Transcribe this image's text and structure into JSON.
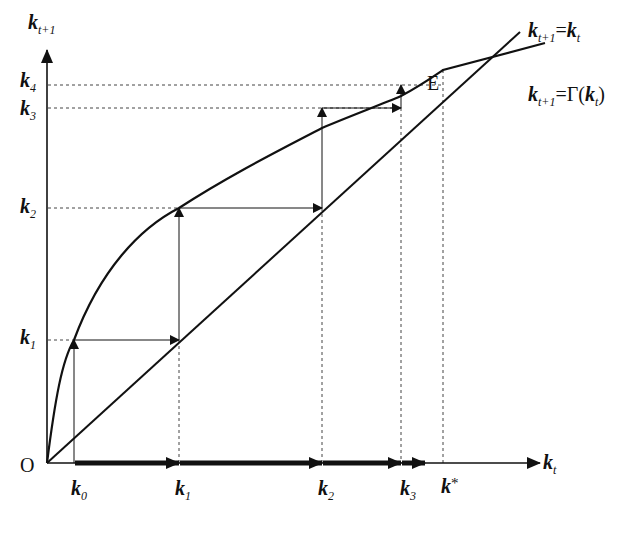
{
  "diagram": {
    "title": "",
    "axes": {
      "y_label": {
        "base": "k",
        "sub": "t+1"
      },
      "x_label": {
        "base": "k",
        "sub": "t"
      },
      "origin": "O"
    },
    "curves": {
      "diagonal": {
        "base": "k",
        "sub": "t+1",
        "eq": "=",
        "rhs_base": "k",
        "rhs_sub": "t"
      },
      "gamma": {
        "base": "k",
        "sub": "t+1",
        "eq": "=Γ(",
        "rhs_base": "k",
        "rhs_sub": "t",
        "close": ")"
      }
    },
    "equilibrium": "E",
    "x_ticks": [
      {
        "base": "k",
        "sub": "0"
      },
      {
        "base": "k",
        "sub": "1"
      },
      {
        "base": "k",
        "sub": "2"
      },
      {
        "base": "k",
        "sub": "3"
      },
      {
        "base": "k",
        "sub": "*"
      }
    ],
    "y_ticks": [
      {
        "base": "k",
        "sub": "4"
      },
      {
        "base": "k",
        "sub": "3"
      },
      {
        "base": "k",
        "sub": "2"
      },
      {
        "base": "k",
        "sub": "1"
      }
    ]
  }
}
